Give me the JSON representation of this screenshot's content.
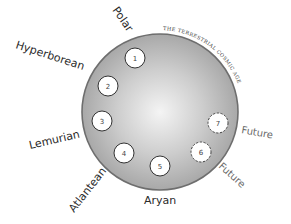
{
  "diagram": {
    "title": "THE TERRESTRIAL COSMIC AGE",
    "colors": {
      "background": "#ffffff",
      "disc_fill_center": "#f2f2f2",
      "disc_fill_edge": "#a9a9a9",
      "disc_stroke": "#6e6e6e",
      "epoch_fill": "#ffffff",
      "epoch_stroke": "#333333",
      "future_label": "#6a6a6a"
    },
    "epochs": [
      {
        "number": "1",
        "label": "Polar",
        "status": "past"
      },
      {
        "number": "2",
        "label": "Hyperborean",
        "status": "past"
      },
      {
        "number": "3",
        "label": "Lemurian",
        "status": "past"
      },
      {
        "number": "4",
        "label": "Atlantean",
        "status": "past"
      },
      {
        "number": "5",
        "label": "Aryan",
        "status": "current"
      },
      {
        "number": "6",
        "label": "Future",
        "status": "future"
      },
      {
        "number": "7",
        "label": "Future",
        "status": "future"
      }
    ]
  }
}
